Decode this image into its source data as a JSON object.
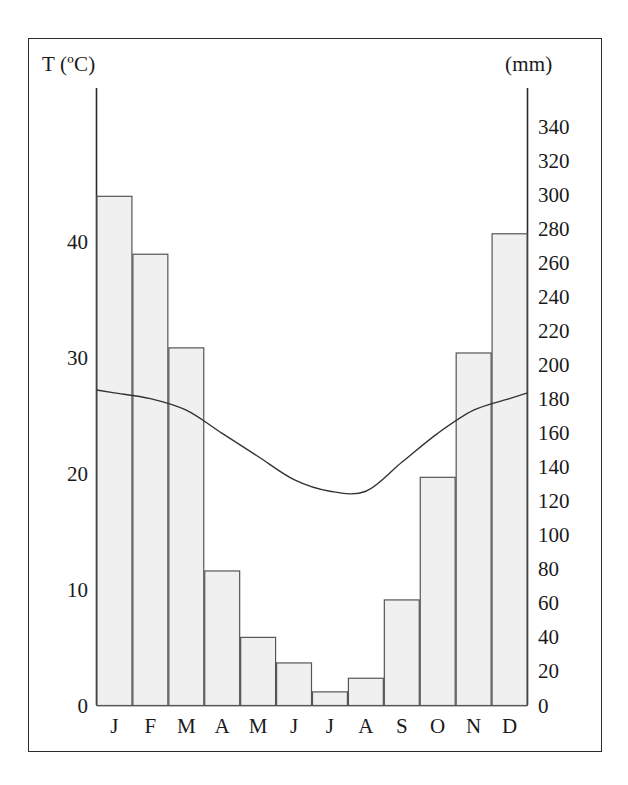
{
  "chart_data": {
    "type": "bar",
    "title": "",
    "subtitle": "",
    "categories": [
      "J",
      "F",
      "M",
      "A",
      "M",
      "J",
      "J",
      "A",
      "S",
      "O",
      "N",
      "D"
    ],
    "month_labels": [
      "J",
      "F",
      "M",
      "A",
      "M",
      "J",
      "J",
      "A",
      "S",
      "O",
      "N",
      "D"
    ],
    "series": [
      {
        "name": "Precipitation",
        "type": "bar",
        "axis": "right",
        "unit": "mm",
        "values": [
          299,
          265,
          210,
          79,
          40,
          25,
          8,
          16,
          62,
          134,
          207,
          277
        ]
      },
      {
        "name": "Temperature",
        "type": "line",
        "axis": "left",
        "unit": "ºC",
        "values": [
          27,
          26.5,
          25.5,
          23.5,
          21.5,
          19.5,
          18.5,
          18.5,
          21,
          23.5,
          25.5,
          26.5
        ]
      }
    ],
    "xlabel": "",
    "ylabel": "T (ºC)",
    "ylabel_right": "(mm)",
    "ylim": [
      0,
      50
    ],
    "ylim_right": [
      0,
      350
    ],
    "yticks": [
      0,
      10,
      20,
      30,
      40
    ],
    "yticks_right": [
      0,
      20,
      40,
      60,
      80,
      100,
      120,
      140,
      160,
      180,
      200,
      220,
      240,
      260,
      280,
      300,
      320,
      340
    ],
    "grid": false,
    "legend": "none",
    "bar_fill_color": "#f0f0f0",
    "bar_stroke_color": "#555555",
    "line_color": "#333333",
    "axis_color": "#2b2b2b",
    "frame_color": "#2b2b2b"
  },
  "axes": {
    "left_title": "T (ºC)",
    "right_title": "(mm)",
    "left_ticks": [
      "40",
      "30",
      "20",
      "10",
      "0"
    ],
    "right_ticks": [
      "340",
      "320",
      "300",
      "280",
      "260",
      "240",
      "220",
      "200",
      "180",
      "160",
      "140",
      "120",
      "100",
      "80",
      "60",
      "40",
      "20",
      "0"
    ]
  },
  "months": [
    "J",
    "F",
    "M",
    "A",
    "M",
    "J",
    "J",
    "A",
    "S",
    "O",
    "N",
    "D"
  ]
}
